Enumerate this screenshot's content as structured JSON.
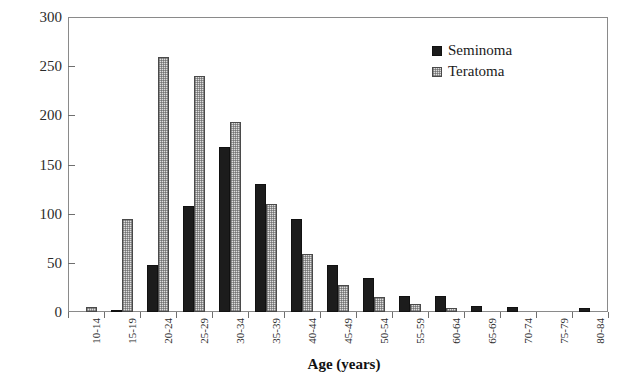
{
  "chart_data": {
    "type": "bar",
    "title": "",
    "subtitle": "",
    "xlabel": "Age (years)",
    "ylabel": "Number of patients",
    "categories": [
      "10-14",
      "15-19",
      "20-24",
      "25-29",
      "30-34",
      "35-39",
      "40-44",
      "45-49",
      "50-54",
      "55-59",
      "60-64",
      "65-69",
      "70-74",
      "75-79",
      "80-84"
    ],
    "series": [
      {
        "name": "Seminoma",
        "color": "#1c1c1c",
        "fill": "solid-black",
        "values": [
          0,
          2,
          48,
          108,
          168,
          130,
          95,
          48,
          35,
          16,
          16,
          6,
          5,
          0,
          4
        ]
      },
      {
        "name": "Teratoma",
        "color": "#dedede",
        "fill": "light-stipple",
        "values": [
          5,
          95,
          259,
          240,
          193,
          110,
          59,
          27,
          15,
          8,
          4,
          0,
          0,
          0,
          0
        ]
      }
    ],
    "ylim": [
      0,
      300
    ],
    "yticks": [
      0,
      50,
      100,
      150,
      200,
      250,
      300
    ],
    "ytick_labels": [
      "0",
      "50",
      "100",
      "150",
      "200",
      "250",
      "300"
    ],
    "grid": false,
    "legend_position": "top-right",
    "legend_entries": [
      "Seminoma",
      "Teratoma"
    ]
  }
}
